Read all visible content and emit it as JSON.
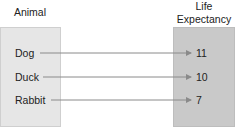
{
  "headers": {
    "domain": "Animal",
    "range": "Life\nExpectancy"
  },
  "mapping": [
    {
      "animal": "Dog",
      "life_expectancy": "11"
    },
    {
      "animal": "Duck",
      "life_expectancy": "10"
    },
    {
      "animal": "Rabbit",
      "life_expectancy": "7"
    }
  ],
  "colors": {
    "left_box": "#e6e6e6",
    "right_box": "#c9c9c9",
    "arrow": "#8a8a8a"
  }
}
